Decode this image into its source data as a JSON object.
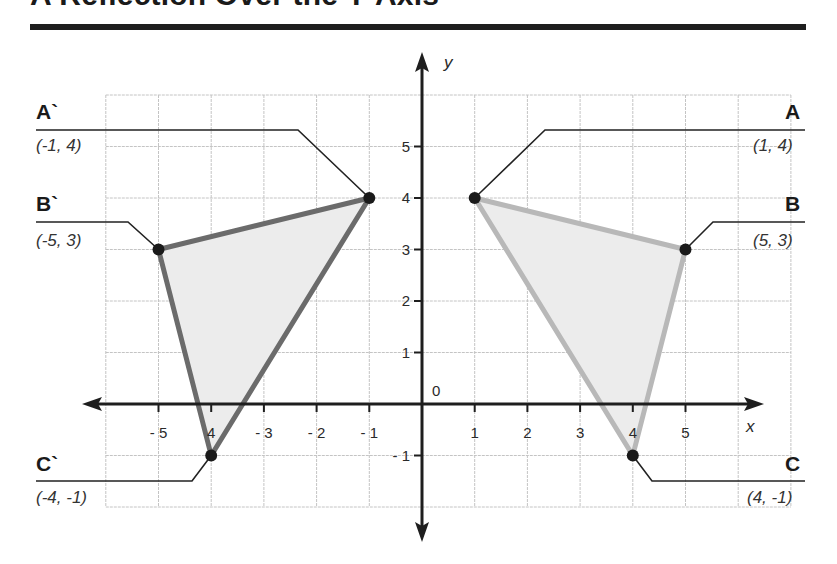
{
  "title": "A Reflection Over the Y-Axis",
  "axes": {
    "x_label": "x",
    "y_label": "y",
    "origin_label": "0",
    "x_ticks": [
      {
        "value": -5,
        "label": "- 5"
      },
      {
        "value": -4,
        "label": "4"
      },
      {
        "value": -3,
        "label": "- 3"
      },
      {
        "value": -2,
        "label": "- 2"
      },
      {
        "value": -1,
        "label": "- 1"
      },
      {
        "value": 1,
        "label": "1"
      },
      {
        "value": 2,
        "label": "2"
      },
      {
        "value": 3,
        "label": "3"
      },
      {
        "value": 4,
        "label": "4"
      },
      {
        "value": 5,
        "label": "5"
      }
    ],
    "y_ticks": [
      {
        "value": 5,
        "label": "5"
      },
      {
        "value": 4,
        "label": "4"
      },
      {
        "value": 3,
        "label": "3"
      },
      {
        "value": 2,
        "label": "2"
      },
      {
        "value": 1,
        "label": "1"
      },
      {
        "value": -1,
        "label": "- 1"
      }
    ],
    "grid_x_range": [
      -6,
      7
    ],
    "grid_y_range": [
      -2,
      6
    ]
  },
  "original_triangle": {
    "stroke_color": "#b8b8b8",
    "fill_color": "#ececec",
    "points": [
      {
        "name": "A",
        "coord": "(1, 4)",
        "x": 1,
        "y": 4
      },
      {
        "name": "B",
        "coord": "(5, 3)",
        "x": 5,
        "y": 3
      },
      {
        "name": "C",
        "coord": "(4, -1)",
        "x": 4,
        "y": -1
      }
    ]
  },
  "reflected_triangle": {
    "stroke_color": "#6b6b6b",
    "fill_color": "#ececec",
    "points": [
      {
        "name": "A`",
        "coord": "(-1, 4)",
        "x": -1,
        "y": 4
      },
      {
        "name": "B`",
        "coord": "(-5, 3)",
        "x": -5,
        "y": 3
      },
      {
        "name": "C`",
        "coord": "(-4, -1)",
        "x": -4,
        "y": -1
      }
    ]
  },
  "chart_data": {
    "type": "scatter",
    "title": "A Reflection Over the Y-Axis",
    "xlabel": "x",
    "ylabel": "y",
    "xlim": [
      -6,
      7
    ],
    "ylim": [
      -2,
      6
    ],
    "grid": true,
    "series": [
      {
        "name": "Triangle ABC",
        "points": [
          [
            1,
            4
          ],
          [
            5,
            3
          ],
          [
            4,
            -1
          ]
        ],
        "labels": [
          "A (1, 4)",
          "B (5, 3)",
          "C (4, -1)"
        ]
      },
      {
        "name": "Triangle A`B`C`",
        "points": [
          [
            -1,
            4
          ],
          [
            -5,
            3
          ],
          [
            -4,
            -1
          ]
        ],
        "labels": [
          "A` (-1, 4)",
          "B` (-5, 3)",
          "C` (-4, -1)"
        ]
      }
    ]
  }
}
